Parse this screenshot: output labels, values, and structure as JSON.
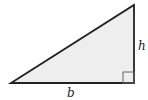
{
  "diagram": {
    "type": "right-triangle",
    "labels": {
      "height": "h",
      "base": "b"
    },
    "colors": {
      "fill": "#eeeeee",
      "stroke": "#222222",
      "marker": "#666666"
    }
  }
}
